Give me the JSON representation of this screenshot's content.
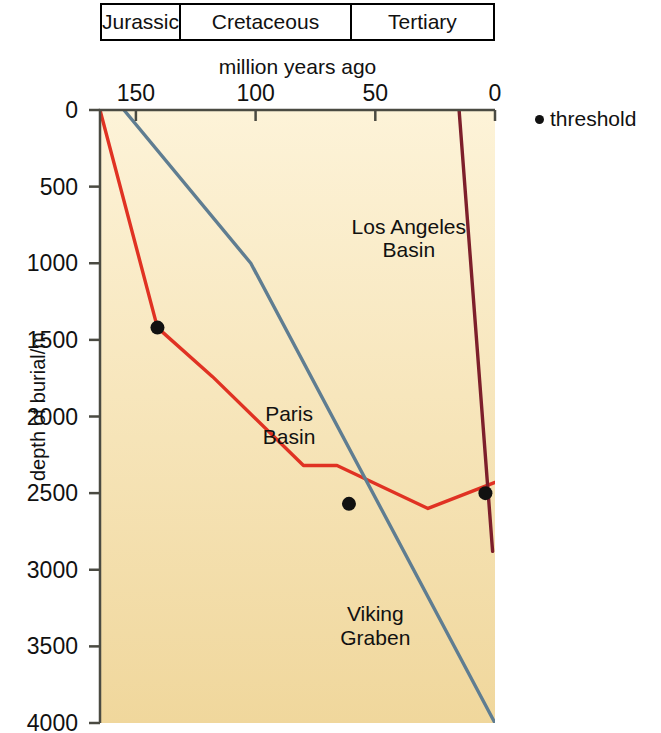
{
  "chart_data": {
    "type": "line",
    "title": "",
    "xlabel": "million years ago",
    "ylabel": "depth of burial/m",
    "xlim": [
      165,
      0
    ],
    "ylim": [
      0,
      4000
    ],
    "x_reversed": true,
    "y_inverted": true,
    "grid": false,
    "xticks": [
      150,
      100,
      50,
      0
    ],
    "xtick_labels": [
      "150",
      "100",
      "50",
      "0"
    ],
    "yticks": [
      0,
      500,
      1000,
      1500,
      2000,
      2500,
      3000,
      3500,
      4000
    ],
    "ytick_labels": [
      "0",
      "500",
      "1000",
      "1500",
      "2000",
      "2500",
      "3000",
      "3500",
      "4000"
    ],
    "plot_bg_top": "#fdf3d8",
    "plot_bg_bottom": "#f0d79c",
    "series": [
      {
        "name": "Paris Basin",
        "color": "#e03223",
        "label_x": 86,
        "label_y": 2060,
        "points": [
          {
            "x": 165,
            "y": 0
          },
          {
            "x": 141,
            "y": 1420
          },
          {
            "x": 118,
            "y": 1740
          },
          {
            "x": 80,
            "y": 2320
          },
          {
            "x": 66,
            "y": 2320
          },
          {
            "x": 28,
            "y": 2600
          },
          {
            "x": 0,
            "y": 2430
          }
        ]
      },
      {
        "name": "Viking Graben",
        "color": "#5f7d91",
        "label_x": 50,
        "label_y": 3370,
        "points": [
          {
            "x": 155,
            "y": 0
          },
          {
            "x": 102,
            "y": 1000
          },
          {
            "x": 0,
            "y": 4000
          }
        ]
      },
      {
        "name": "Los Angeles Basin",
        "color": "#7d1f2b",
        "label_x": 36,
        "label_y": 840,
        "points": [
          {
            "x": 15,
            "y": 0
          },
          {
            "x": 1,
            "y": 2880
          }
        ]
      }
    ],
    "thresholds": [
      {
        "x": 141,
        "y": 1420,
        "series": "Paris Basin"
      },
      {
        "x": 61,
        "y": 2570,
        "series": "Viking Graben"
      },
      {
        "x": 4,
        "y": 2500,
        "series": "Los Angeles Basin"
      }
    ],
    "threshold_color": "#111111",
    "legend": {
      "label": "threshold",
      "position": "right"
    }
  },
  "period_bar": {
    "periods": [
      {
        "name": "Jurassic",
        "start": 165,
        "end": 145
      },
      {
        "name": "Cretaceous",
        "start": 145,
        "end": 66
      },
      {
        "name": "Tertiary",
        "start": 66,
        "end": 0
      }
    ]
  }
}
